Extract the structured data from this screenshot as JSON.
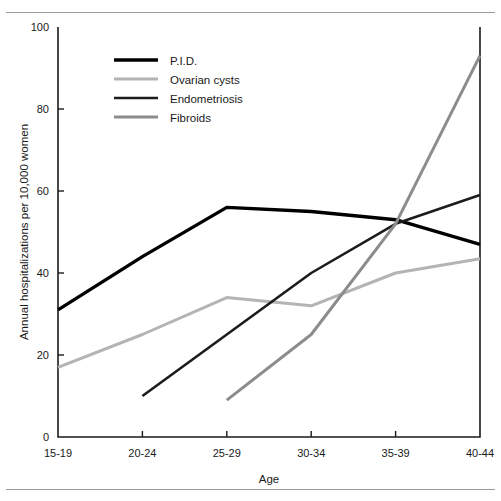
{
  "chart_data": {
    "type": "line",
    "title": "",
    "xlabel": "Age",
    "ylabel": "Annual hospitalizations per 10,000 women",
    "categories": [
      "15-19",
      "20-24",
      "25-29",
      "30-34",
      "35-39",
      "40-44"
    ],
    "yticks": [
      0,
      20,
      40,
      60,
      80,
      100
    ],
    "ylim": [
      0,
      100
    ],
    "grid": false,
    "legend_position": "upper-left-inside",
    "series": [
      {
        "name": "P.I.D.",
        "color": "#000000",
        "width": 3.4,
        "values": [
          31,
          44,
          56,
          55,
          53,
          47
        ]
      },
      {
        "name": "Ovarian cysts",
        "color": "#b4b4b4",
        "width": 3.0,
        "values": [
          17,
          25,
          34,
          32,
          40,
          43.5
        ]
      },
      {
        "name": "Endometriosis",
        "color": "#1c1c1c",
        "width": 2.6,
        "values": [
          null,
          10,
          25,
          40,
          52,
          59
        ]
      },
      {
        "name": "Fibroids",
        "color": "#8c8c8c",
        "width": 3.0,
        "values": [
          null,
          null,
          9,
          25,
          52,
          93
        ]
      }
    ]
  },
  "axis": {
    "ytick_labels": [
      "0",
      "20",
      "40",
      "60",
      "80",
      "100"
    ],
    "xtick_labels": [
      "15-19",
      "20-24",
      "25-29",
      "30-34",
      "35-39",
      "40-44"
    ],
    "x_title": "Age",
    "y_title": "Annual hospitalizations per 10,000 women"
  },
  "legend": {
    "items": [
      {
        "label": "P.I.D."
      },
      {
        "label": "Ovarian cysts"
      },
      {
        "label": "Endometriosis"
      },
      {
        "label": "Fibroids"
      }
    ]
  },
  "colors": {
    "axis_line": "#1a1a1a",
    "rule": "#9a9a9a",
    "background": "#ffffff"
  }
}
